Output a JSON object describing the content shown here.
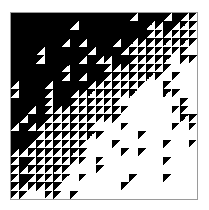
{
  "artwork": {
    "title": "",
    "grid_size": 22,
    "palette": {
      "dark": "#000000",
      "light": "#ffffff",
      "frame": "#9a9a9a"
    },
    "legend": {
      "B": "solid black cell",
      "W": "solid white cell",
      "w": "black cell with white lower-right triangle",
      "k": "white cell with black upper-left triangle"
    },
    "rows": [
      "BBBBBBBBBBBBBBwBBBwBwk",
      "BBBBBBBwBBBBBBBBwwBwwk",
      "BBBBBBBBBBBBBBBBwwwwwk",
      "BBBBBBwBwBBBwBwwwwwwwk",
      "BBBwBBBBBwBBBwwwwkkkkW",
      "BBBwBBBBwBwwBBwwwkkWkk",
      "BBBBBBwBBBBwwwwwkkkWWW",
      "BBBBBBwBwBBwwwwwkkWkWW",
      "wBBBwBBBBwwwwwkkWWkWWW",
      "wBBBwBBwwwwwkkkWWWkkWW",
      "BBBBwBBwwwwkkWWWWWWWkW",
      "BBwBwwwwwwkkkkWWWWWkkW",
      "BwBBwwwwkkkkkWWWWWWWkk",
      "wBwwwwwkkkWWWkWWWWWkWk",
      "BBBwwwwwkkkWWWWkWWWWWW",
      "BBwwwwwkkWWWkWWWWWkWWk",
      "wwwwwwwkkWWWWkWkWWWWWW",
      "wBwwwkkkkWkWWWWWWWkWWW",
      "wwwwkkkWWWkWWWWWWWWWWW",
      "wBwwwkkWkWWWWWkWWWkWWW",
      "wwwkkkWWWWWWWkWWWWWWWW",
      "kkWWkkWkWWWWWWWWWWWWWW"
    ]
  }
}
